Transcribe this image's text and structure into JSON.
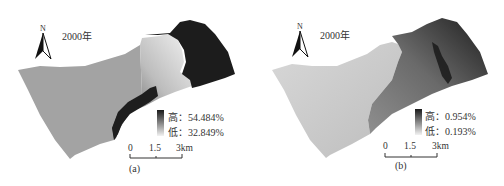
{
  "panels": [
    {
      "id": "a",
      "year_label": "2000年",
      "north_label": "N",
      "legend": {
        "high_label": "高：54.484%",
        "low_label": "低：32.849%",
        "high_color": "#1a1a1a",
        "low_color": "#f2f2f2"
      },
      "scale": {
        "ticks": [
          "0",
          "1.5",
          "3km"
        ]
      },
      "caption": "(a)"
    },
    {
      "id": "b",
      "year_label": "2000年",
      "north_label": "N",
      "legend": {
        "high_label": "高：0.954%",
        "low_label": "低：0.193%",
        "high_color": "#1a1a1a",
        "low_color": "#f2f2f2"
      },
      "scale": {
        "ticks": [
          "0",
          "1.5",
          "3km"
        ]
      },
      "caption": "(b)"
    }
  ]
}
